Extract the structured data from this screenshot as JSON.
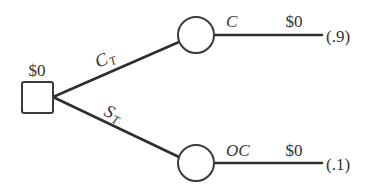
{
  "diagram": {
    "type": "decision-tree",
    "root": {
      "kind": "decision",
      "value_label": "$0"
    },
    "branches": [
      {
        "label_main": "C",
        "label_sub": "T",
        "chance_node": {
          "kind": "chance",
          "outcome_label": "C",
          "payoff": "$0",
          "probability": "(.9)"
        }
      },
      {
        "label_main": "S",
        "label_sub": "T",
        "chance_node": {
          "kind": "chance",
          "outcome_label": "OC",
          "payoff": "$0",
          "probability": "(.1)"
        }
      }
    ]
  }
}
